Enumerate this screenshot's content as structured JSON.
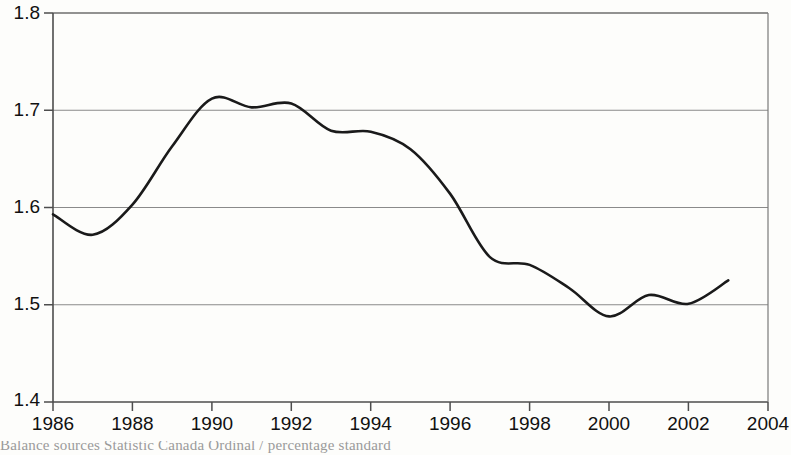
{
  "chart_data": {
    "type": "line",
    "title": "",
    "subtitle": "",
    "xlabel": "",
    "ylabel": "",
    "xlim": [
      1986,
      2004
    ],
    "ylim": [
      1.4,
      1.8
    ],
    "grid": true,
    "grid_axis": "y",
    "legend": false,
    "legend_position": "none",
    "x_ticks": [
      "1986",
      "1988",
      "1990",
      "1992",
      "1994",
      "1996",
      "1998",
      "2000",
      "2002",
      "2004"
    ],
    "x_tick_values": [
      1986,
      1988,
      1990,
      1992,
      1994,
      1996,
      1998,
      2000,
      2002,
      2004
    ],
    "y_ticks": [
      "1.4",
      "1.5",
      "1.6",
      "1.7",
      "1.8"
    ],
    "y_tick_values": [
      1.4,
      1.5,
      1.6,
      1.7,
      1.8
    ],
    "series": [
      {
        "name": "series-1",
        "color": "#1a1a1a",
        "x": [
          1986,
          1987,
          1988,
          1989,
          1990,
          1991,
          1992,
          1993,
          1994,
          1995,
          1996,
          1997,
          1998,
          1999,
          2000,
          2001,
          2002,
          2003
        ],
        "values": [
          1.593,
          1.572,
          1.603,
          1.663,
          1.712,
          1.703,
          1.707,
          1.679,
          1.678,
          1.66,
          1.614,
          1.549,
          1.541,
          1.517,
          1.488,
          1.51,
          1.501,
          1.525
        ]
      }
    ]
  },
  "axes": {
    "y_tick_labels": [
      "1.8",
      "1.7",
      "1.6",
      "1.5",
      "1.4"
    ],
    "x_tick_labels": [
      "1986",
      "1988",
      "1990",
      "1992",
      "1994",
      "1996",
      "1998",
      "2000",
      "2002",
      "2004"
    ]
  },
  "caption": {
    "text": "Balance  sources  Statistic Canada  Ordinal  /  percentage  standard",
    "visible": "partially-clipped"
  },
  "colors": {
    "line": "#1a1a1a",
    "gridline": "#808080",
    "axis": "#4d4d4d",
    "background": "#fdfdfb",
    "tick_text": "#111111"
  }
}
